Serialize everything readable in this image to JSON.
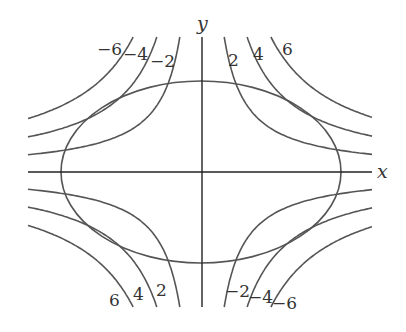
{
  "diagram": {
    "axes": {
      "x_label": "x",
      "y_label": "y",
      "origin_px": [
        202,
        172
      ],
      "x_range_px": [
        28,
        372
      ],
      "y_range_px": [
        37,
        307
      ]
    },
    "ellipse": {
      "cx": 201,
      "cy": 172,
      "rx": 140,
      "ry": 91
    },
    "hyperbola_scale": {
      "2": 3000,
      "4": 6100,
      "6": 9300
    },
    "curve_extent": {
      "x_min_px": 28,
      "x_max_px": 372,
      "y_min_px": 37,
      "y_max_px": 307
    },
    "labels": {
      "q1": [
        {
          "text": "2",
          "x": 228,
          "y": 66
        },
        {
          "text": "4",
          "x": 253,
          "y": 60
        },
        {
          "text": "6",
          "x": 282,
          "y": 55
        }
      ],
      "q2": [
        {
          "text": "−6",
          "x": 97,
          "y": 55
        },
        {
          "text": "−4",
          "x": 123,
          "y": 60
        },
        {
          "text": "−2",
          "x": 150,
          "y": 67
        }
      ],
      "q3": [
        {
          "text": "6",
          "x": 109,
          "y": 306
        },
        {
          "text": "4",
          "x": 133,
          "y": 300
        },
        {
          "text": "2",
          "x": 156,
          "y": 296
        }
      ],
      "q4": [
        {
          "text": "−2",
          "x": 225,
          "y": 297
        },
        {
          "text": "−4",
          "x": 248,
          "y": 303
        },
        {
          "text": "−6",
          "x": 272,
          "y": 309
        }
      ]
    },
    "colors": {
      "curve": "#555555",
      "axis": "#222222",
      "text": "#333333"
    }
  }
}
